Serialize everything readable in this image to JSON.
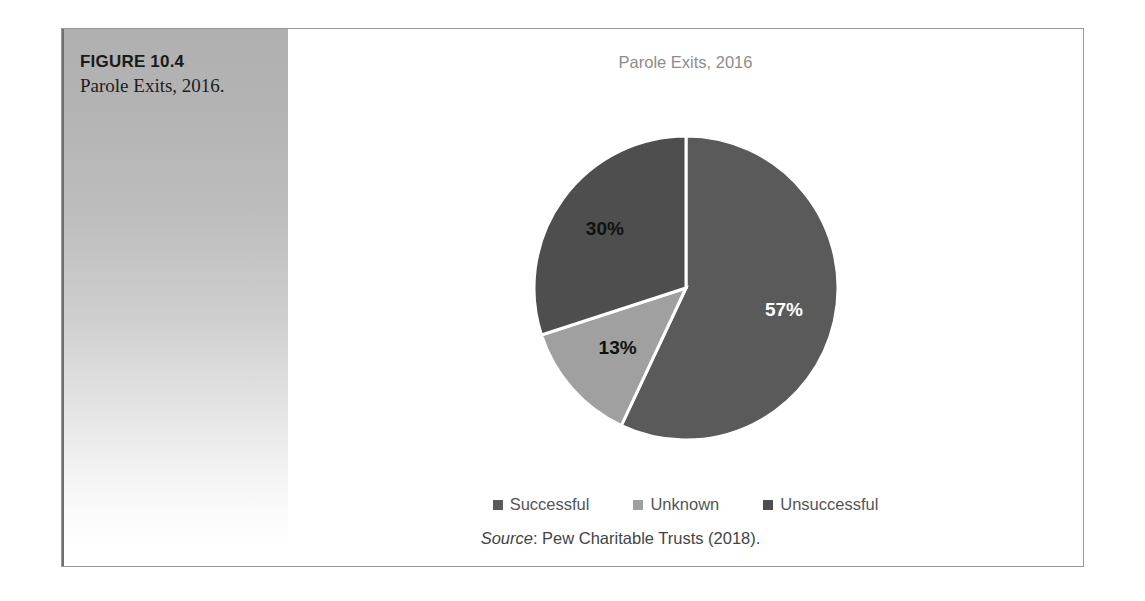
{
  "figure": {
    "number_label": "FIGURE 10.4",
    "caption": "Parole Exits, 2016.",
    "frame_border_color": "#9a9a9a",
    "panel_gradient_top": "#b0b0b0",
    "panel_gradient_bottom": "#ffffff"
  },
  "chart_data": {
    "type": "pie",
    "title": "Parole Exits, 2016",
    "categories": [
      "Successful",
      "Unknown",
      "Unsuccessful"
    ],
    "values": [
      57,
      13,
      30
    ],
    "value_labels": [
      "57%",
      "13%",
      "30%"
    ],
    "colors": [
      "#5a5a5a",
      "#a0a0a0",
      "#4e4e4e"
    ],
    "label_colors": [
      "#ffffff",
      "#111111",
      "#111111"
    ],
    "start_angle_deg": 0,
    "direction": "clockwise",
    "slice_border_color": "#ffffff",
    "legend_position": "bottom",
    "grid": false,
    "xlabel": "",
    "ylabel": ""
  },
  "legend": {
    "items": [
      {
        "label": "Successful",
        "color": "#5a5a5a"
      },
      {
        "label": "Unknown",
        "color": "#a0a0a0"
      },
      {
        "label": "Unsuccessful",
        "color": "#4e4e4e"
      }
    ]
  },
  "source": {
    "label": "Source",
    "separator": ": ",
    "text": "Pew Charitable Trusts (2018)."
  }
}
